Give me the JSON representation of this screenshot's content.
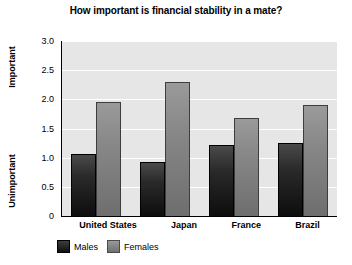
{
  "chart_data": {
    "type": "bar",
    "title": "How important is financial stability in a mate?",
    "categories": [
      "United States",
      "Japan",
      "France",
      "Brazil"
    ],
    "series": [
      {
        "name": "Males",
        "values": [
          1.07,
          0.93,
          1.22,
          1.25
        ]
      },
      {
        "name": "Females",
        "values": [
          1.95,
          2.3,
          1.68,
          1.9
        ]
      }
    ],
    "xlabel": "",
    "ylabel": "",
    "ylim": [
      0,
      3.0
    ],
    "yticks": [
      "3.0",
      "2.5",
      "2.0",
      "1.5",
      "1.0",
      "0.5",
      "0"
    ],
    "ytick_values": [
      3.0,
      2.5,
      2.0,
      1.5,
      1.0,
      0.5,
      0
    ],
    "axis_top_label": "Important",
    "axis_bottom_label": "Unimportant",
    "grid": true,
    "legend_position": "bottom-left",
    "colors": {
      "males": "#1a1a1a",
      "females": "#808080",
      "plot_background": "#e6e6e6",
      "gridline": "#ffffff",
      "axis": "#000000",
      "page_background": "#ffffff"
    }
  }
}
